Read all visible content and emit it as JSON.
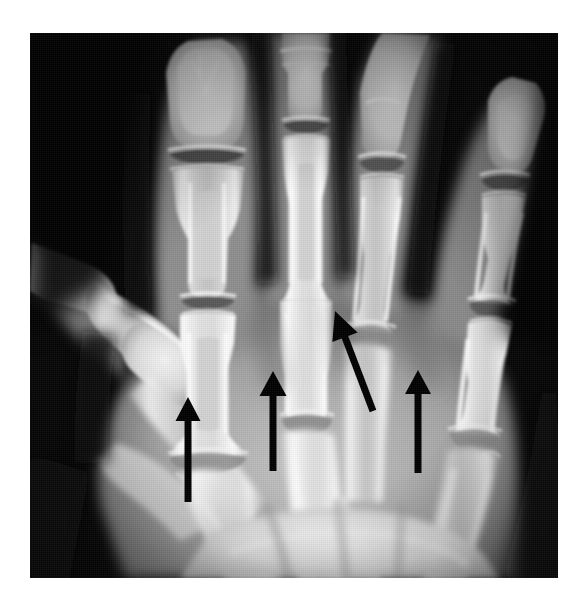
{
  "image": {
    "kind": "radiograph",
    "modality_label": "X-ray",
    "view": "PA hand radiograph",
    "body_part": "hand",
    "background_color": "#ffffff",
    "film_color": "#050505",
    "annotation_color": "#000000",
    "plate": {
      "x": 30,
      "y": 33,
      "width": 528,
      "height": 545
    },
    "canvas": {
      "width": 583,
      "height": 611
    }
  },
  "anatomy": {
    "digits": [
      {
        "name": "thumb",
        "label": "thumb",
        "visible_parts": "distal phalanx, proximal phalanx, first metacarpal"
      },
      {
        "name": "index-finger",
        "label": "index finger",
        "visible_parts": "distal phalanx, DIP joint, middle phalanx, PIP joint, proximal phalanx, MCP joint, second metacarpal"
      },
      {
        "name": "middle-finger",
        "label": "middle finger",
        "visible_parts": "middle phalanx, PIP joint, proximal phalanx, MCP joint, third metacarpal"
      },
      {
        "name": "ring-finger",
        "label": "ring finger",
        "visible_parts": "middle phalanx, PIP joint, proximal phalanx, MCP joint, fourth metacarpal"
      },
      {
        "name": "little-finger",
        "label": "little finger",
        "visible_parts": "distal phalanx, DIP joint, middle phalanx, PIP joint, proximal phalanx, MCP joint, fifth metacarpal"
      }
    ],
    "carpus": {
      "label": "carpal bones and distal wrist",
      "region": "lower portion of the film"
    }
  },
  "annotations": {
    "count": 4,
    "color": "#000000",
    "arrows": [
      {
        "id": "arrow-1",
        "target": "index-finger MCP joint",
        "direction": "up",
        "tip": {
          "x": 188,
          "y": 397
        },
        "tail": {
          "x": 188,
          "y": 502
        },
        "head_width": 25,
        "head_length": 24,
        "shaft_width": 7
      },
      {
        "id": "arrow-2",
        "target": "middle-finger MCP joint",
        "direction": "up",
        "tip": {
          "x": 273,
          "y": 371
        },
        "tail": {
          "x": 273,
          "y": 471
        },
        "head_width": 27,
        "head_length": 25,
        "shaft_width": 7
      },
      {
        "id": "arrow-3",
        "target": "ring-finger MCP joint",
        "direction": "up-left diagonal",
        "tip": {
          "x": 335,
          "y": 311
        },
        "tail": {
          "x": 373,
          "y": 411
        },
        "head_width": 27,
        "head_length": 28,
        "shaft_width": 7
      },
      {
        "id": "arrow-4",
        "target": "little-finger MCP joint",
        "direction": "up",
        "tip": {
          "x": 418,
          "y": 370
        },
        "tail": {
          "x": 418,
          "y": 473
        },
        "head_width": 26,
        "head_length": 24,
        "shaft_width": 7
      }
    ]
  }
}
